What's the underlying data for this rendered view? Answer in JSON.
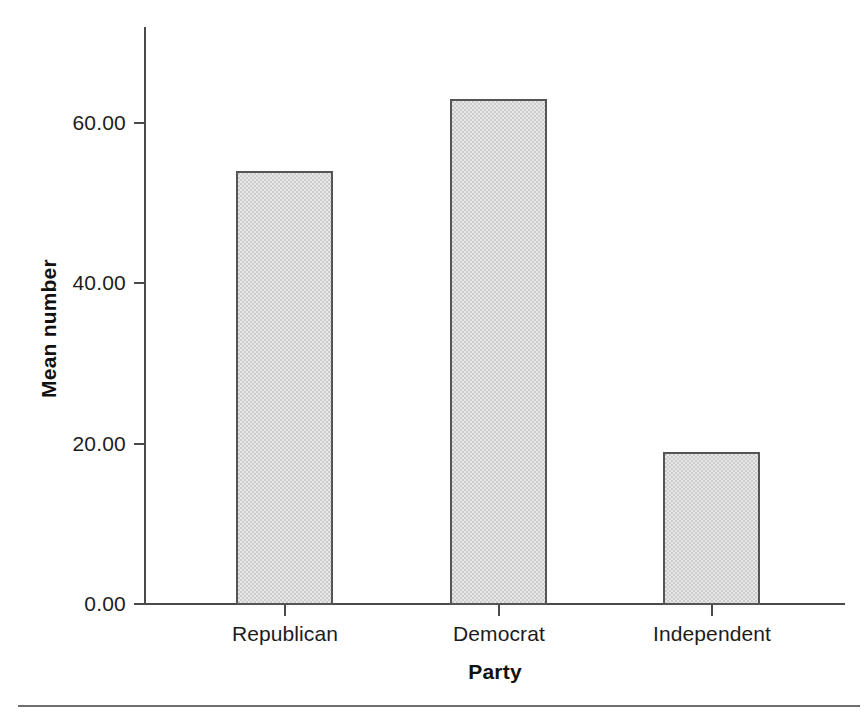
{
  "chart_data": {
    "type": "bar",
    "title": "",
    "subtitle": "",
    "categories": [
      "Republican",
      "Democrat",
      "Independent"
    ],
    "values": [
      54,
      63,
      19
    ],
    "series": [
      {
        "name": "Mean number",
        "values": [
          54,
          63,
          19
        ]
      }
    ],
    "xlabel": "Party",
    "ylabel": "Mean number",
    "ylim": [
      0,
      60
    ],
    "y_axis_display_max": 68,
    "yticks": [
      0,
      20,
      40,
      60
    ],
    "ytick_labels": [
      "0.00",
      "20.00",
      "40.00",
      "60.00"
    ],
    "xtick_labels": [
      "Republican",
      "Democrat",
      "Independent"
    ],
    "grid": false,
    "legend": false,
    "legend_position": "none",
    "bar_fill_color": "#cbcbcb",
    "bar_border_color": "#555555",
    "axis_color": "#4a4a4a",
    "background_color": "#ffffff",
    "text_color": "#1c1c1c"
  },
  "axes": {
    "y_title": "Mean number",
    "x_title": "Party",
    "y_ticks": [
      {
        "label": "60.00",
        "value": 60
      },
      {
        "label": "40.00",
        "value": 40
      },
      {
        "label": "20.00",
        "value": 20
      },
      {
        "label": "0.00",
        "value": 0
      }
    ],
    "x_ticks": [
      {
        "label": "Republican",
        "value": 54
      },
      {
        "label": "Democrat",
        "value": 63
      },
      {
        "label": "Independent",
        "value": 19
      }
    ]
  }
}
